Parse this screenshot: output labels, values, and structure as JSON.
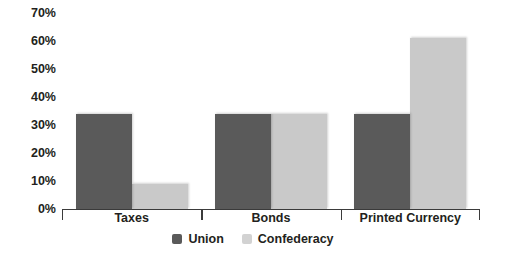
{
  "chart_data": {
    "type": "bar",
    "title": "",
    "subtitle": "",
    "xlabel": "",
    "ylabel": "",
    "categories": [
      "Taxes",
      "Bonds",
      "Printed Currency"
    ],
    "series": [
      {
        "name": "Union",
        "color": "#5a5a5a",
        "values": [
          34,
          34,
          34
        ]
      },
      {
        "name": "Confederacy",
        "color": "#c9c9c9",
        "values": [
          9,
          34,
          61
        ]
      }
    ],
    "ylim": [
      0,
      70
    ],
    "ytick_values": [
      0,
      10,
      20,
      30,
      40,
      50,
      60,
      70
    ],
    "ytick_labels": [
      "0%",
      "10%",
      "20%",
      "30%",
      "40%",
      "50%",
      "60%",
      "70%"
    ],
    "grid": false,
    "legend_position": "bottom",
    "annotations": []
  },
  "legend": {
    "items": [
      {
        "label": "Union",
        "swatch": "union-swatch"
      },
      {
        "label": "Confederacy",
        "swatch": "confederacy-swatch"
      }
    ]
  }
}
